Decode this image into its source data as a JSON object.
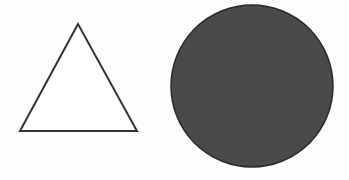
{
  "diagram": {
    "background": "#fdfdfd",
    "shapes": [
      {
        "type": "triangle",
        "fill": "#ffffff",
        "stroke": "#333333",
        "points": "78,24 20,131 137,131"
      },
      {
        "type": "circle",
        "fill": "#4a4a4a",
        "stroke": "#2a2a2a",
        "cx": "252",
        "cy": "86",
        "r": "81"
      }
    ]
  }
}
